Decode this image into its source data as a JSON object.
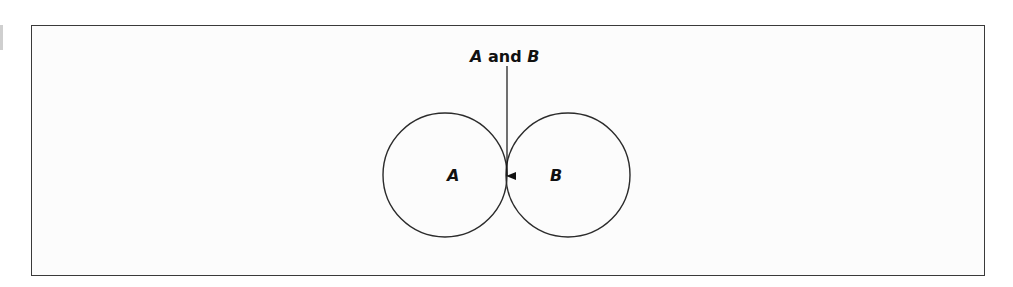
{
  "diagram": {
    "type": "venn",
    "title_parts": {
      "a": "A",
      "and": " and ",
      "b": "B"
    },
    "sets": [
      {
        "label": "A",
        "cx": 445,
        "cy": 175,
        "r": 62
      },
      {
        "label": "B",
        "cx": 568,
        "cy": 175,
        "r": 62
      }
    ],
    "intersection": {
      "label": "A and B",
      "fill": "#7a7a7a"
    },
    "colors": {
      "stroke": "#2b2b2b",
      "frame": "#3a3a3a",
      "background": "#fcfcfc"
    }
  }
}
